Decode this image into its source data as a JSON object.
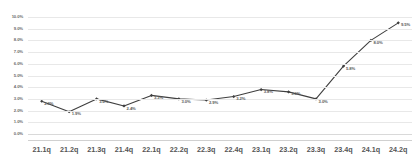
{
  "chart_data": {
    "type": "line",
    "title": "",
    "subtitle": "",
    "xlabel": "",
    "ylabel": "",
    "grid": true,
    "legend": false,
    "legend_position": "none",
    "categories": [
      "21.1q",
      "21.2q",
      "21.3q",
      "21.4q",
      "22.1q",
      "22.2q",
      "22.3q",
      "22.4q",
      "23.1q",
      "23.2q",
      "23.3q",
      "23.4q",
      "24.1q",
      "24.2q"
    ],
    "values": [
      2.8,
      1.9,
      3.0,
      2.4,
      3.3,
      3.0,
      2.9,
      3.2,
      3.8,
      3.6,
      3.0,
      5.8,
      8.0,
      9.5
    ],
    "data_labels": [
      "2.8%",
      "1.9%",
      "3.0%",
      "2.4%",
      "3.3%",
      "3.0%",
      "2.9%",
      "3.2%",
      "3.8%",
      "3.6%",
      "3.0%",
      "5.8%",
      "8.0%",
      "9.5%"
    ],
    "ylim": [
      0.0,
      10.0
    ],
    "ytick_values": [
      0.0,
      1.0,
      2.0,
      3.0,
      4.0,
      5.0,
      6.0,
      7.0,
      8.0,
      9.0,
      10.0
    ],
    "ytick_labels": [
      "0.0%",
      "1.0%",
      "2.0%",
      "3.0%",
      "4.0%",
      "5.0%",
      "6.0%",
      "7.0%",
      "8.0%",
      "9.0%",
      "10.0%"
    ],
    "series_color": "#3f3f3f",
    "marker": "diamond",
    "marker_color": "#3f3f3f"
  }
}
